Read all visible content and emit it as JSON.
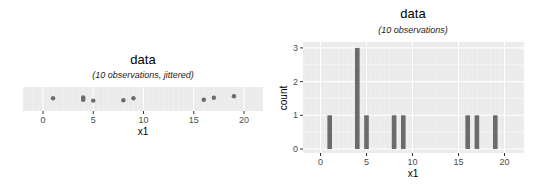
{
  "chart_data": [
    {
      "type": "scatter",
      "title": "data",
      "subtitle": "(10 observations, jittered)",
      "xlabel": "x1",
      "ylabel": "",
      "xlim": [
        -1,
        22
      ],
      "xticks": [
        0,
        5,
        10,
        15,
        20
      ],
      "grid": true,
      "x": [
        1,
        4,
        4,
        4,
        5,
        8,
        9,
        16,
        17,
        19
      ],
      "jitter_y": [
        0.1,
        0.2,
        0.0,
        -0.1,
        -0.2,
        -0.15,
        0.1,
        -0.1,
        0.15,
        0.35
      ]
    },
    {
      "type": "bar",
      "title": "data",
      "subtitle": "(10 observations)",
      "xlabel": "x1",
      "ylabel": "count",
      "xlim": [
        -1,
        22
      ],
      "ylim": [
        0,
        3
      ],
      "xticks": [
        0,
        5,
        10,
        15,
        20
      ],
      "yticks": [
        0,
        1,
        2,
        3
      ],
      "grid": true,
      "categories": [
        1,
        4,
        5,
        8,
        9,
        16,
        17,
        19
      ],
      "values": [
        1,
        3,
        1,
        1,
        1,
        1,
        1,
        1
      ]
    }
  ],
  "colors": {
    "panel": "#ebebeb",
    "grid": "#ffffff",
    "mark": "#6b6b6b"
  }
}
